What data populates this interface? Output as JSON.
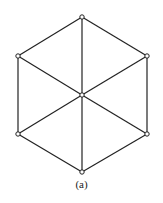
{
  "diagram": {
    "type": "graph",
    "caption": "(a)",
    "stroke_color": "#222222",
    "vertices": [
      {
        "id": "top",
        "x": 82,
        "y": 17
      },
      {
        "id": "upper-right",
        "x": 147,
        "y": 56
      },
      {
        "id": "lower-right",
        "x": 147,
        "y": 134
      },
      {
        "id": "bottom",
        "x": 82,
        "y": 172
      },
      {
        "id": "lower-left",
        "x": 18,
        "y": 134
      },
      {
        "id": "upper-left",
        "x": 18,
        "y": 56
      },
      {
        "id": "center",
        "x": 82,
        "y": 95
      }
    ],
    "edges": [
      [
        "top",
        "upper-right"
      ],
      [
        "upper-right",
        "lower-right"
      ],
      [
        "lower-right",
        "bottom"
      ],
      [
        "bottom",
        "lower-left"
      ],
      [
        "lower-left",
        "upper-left"
      ],
      [
        "upper-left",
        "top"
      ],
      [
        "center",
        "top"
      ],
      [
        "center",
        "upper-right"
      ],
      [
        "center",
        "lower-right"
      ],
      [
        "center",
        "bottom"
      ],
      [
        "center",
        "lower-left"
      ],
      [
        "center",
        "upper-left"
      ]
    ]
  }
}
